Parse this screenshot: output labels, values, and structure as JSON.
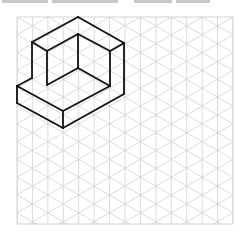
{
  "figure": {
    "type": "isometric-drawing",
    "grid": {
      "x0": 17,
      "y0": 17,
      "x1": 233,
      "y1": 224,
      "column_spacing": 15.43,
      "iso_rise": 8.9,
      "line_color": "#d2d2d2",
      "border_color": "#c8c8c8"
    },
    "object": {
      "stroke_color": "#111111",
      "stroke_width": 1.8,
      "edges": [
        [
          [
            78,
            17
          ],
          [
            124,
            43
          ]
        ],
        [
          [
            78,
            17
          ],
          [
            32,
            42
          ]
        ],
        [
          [
            32,
            42
          ],
          [
            47,
            51
          ]
        ],
        [
          [
            47,
            51
          ],
          [
            78,
            34
          ]
        ],
        [
          [
            78,
            34
          ],
          [
            110,
            51
          ]
        ],
        [
          [
            110,
            51
          ],
          [
            124,
            43
          ]
        ],
        [
          [
            78,
            34
          ],
          [
            78,
            68
          ]
        ],
        [
          [
            32,
            42
          ],
          [
            32,
            78
          ]
        ],
        [
          [
            47,
            51
          ],
          [
            47,
            85
          ]
        ],
        [
          [
            110,
            51
          ],
          [
            110,
            86
          ]
        ],
        [
          [
            124,
            43
          ],
          [
            124,
            94
          ]
        ],
        [
          [
            47,
            85
          ],
          [
            78,
            68
          ]
        ],
        [
          [
            78,
            68
          ],
          [
            110,
            86
          ]
        ],
        [
          [
            32,
            78
          ],
          [
            17,
            86
          ]
        ],
        [
          [
            17,
            86
          ],
          [
            63,
            111
          ]
        ],
        [
          [
            63,
            111
          ],
          [
            110,
            86
          ]
        ],
        [
          [
            17,
            86
          ],
          [
            17,
            103
          ]
        ],
        [
          [
            17,
            103
          ],
          [
            63,
            128
          ]
        ],
        [
          [
            63,
            111
          ],
          [
            63,
            128
          ]
        ],
        [
          [
            63,
            128
          ],
          [
            124,
            94
          ]
        ]
      ]
    }
  },
  "header_cropped_text": {
    "visible": true,
    "legible": false,
    "segments": [
      [
        2,
        48
      ],
      [
        52,
        118
      ],
      [
        134,
        172
      ],
      [
        176,
        210
      ]
    ]
  }
}
